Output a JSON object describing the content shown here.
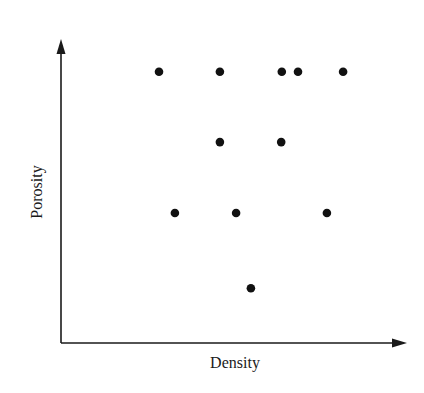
{
  "chart_data": {
    "type": "scatter",
    "title": "",
    "xlabel": "Density",
    "ylabel": "Porosity",
    "xlim": [
      0,
      10
    ],
    "ylim": [
      0,
      10
    ],
    "grid": false,
    "legend": null,
    "ticks": "none",
    "axes_style": "arrows",
    "series": [
      {
        "name": "samples",
        "color": "#111111",
        "points": [
          {
            "x": 2.85,
            "y": 8.95
          },
          {
            "x": 4.62,
            "y": 8.95
          },
          {
            "x": 6.42,
            "y": 8.95
          },
          {
            "x": 6.89,
            "y": 8.95
          },
          {
            "x": 8.2,
            "y": 8.95
          },
          {
            "x": 4.62,
            "y": 6.63
          },
          {
            "x": 6.4,
            "y": 6.63
          },
          {
            "x": 3.31,
            "y": 4.29
          },
          {
            "x": 5.09,
            "y": 4.29
          },
          {
            "x": 7.73,
            "y": 4.29
          },
          {
            "x": 5.52,
            "y": 1.81
          }
        ]
      }
    ]
  },
  "layout": {
    "origin_px": [
      61,
      343
    ],
    "x_end_px": 405,
    "y_end_px": 40,
    "axis_color": "#1a1a1a",
    "point_radius_px": 4.3
  }
}
